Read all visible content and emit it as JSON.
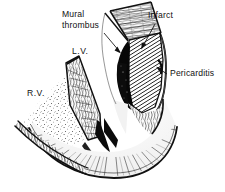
{
  "figure": {
    "background_color": "#ffffff",
    "ink_color": "#111111",
    "width": 225,
    "height": 192,
    "labels": [
      {
        "id": "mural-thrombus",
        "line1": "Mural",
        "line2": "thrombus",
        "x": 62,
        "y": 17,
        "leader": "arrow pointing down-right to dark thrombus mass"
      },
      {
        "id": "infarct",
        "line1": "Infarct",
        "line2": "",
        "x": 148,
        "y": 18,
        "leader": "arrow pointing down-left into hatched wall region"
      },
      {
        "id": "pericarditis",
        "line1": "Pericarditis",
        "line2": "",
        "x": 170,
        "y": 73,
        "leader": "arrow pointing left to outer epicardial surface"
      },
      {
        "id": "left-ventricle",
        "line1": "L.V.",
        "line2": "",
        "x": 72,
        "y": 54,
        "leader": "none"
      },
      {
        "id": "right-ventricle",
        "line1": "R.V.",
        "line2": "",
        "x": 27,
        "y": 96,
        "leader": "none"
      }
    ],
    "structures": [
      {
        "id": "lv-free-wall",
        "name": "Left ventricular free wall",
        "texture": "diagonal-hatch"
      },
      {
        "id": "mural-thrombus-mass",
        "name": "Mural thrombus",
        "texture": "solid-black"
      },
      {
        "id": "interventricular-septum",
        "name": "Interventricular septum",
        "texture": "fibrous-streaks"
      },
      {
        "id": "rv-free-wall",
        "name": "Right ventricular free wall",
        "texture": "fibrous-streaks"
      },
      {
        "id": "rv-cavity",
        "name": "Right ventricular cavity",
        "texture": "stipple"
      },
      {
        "id": "lv-cavity",
        "name": "Left ventricular cavity",
        "texture": "solid-black-wedge"
      },
      {
        "id": "apex",
        "name": "Cardiac apex",
        "texture": "radiating-fibers"
      }
    ]
  }
}
